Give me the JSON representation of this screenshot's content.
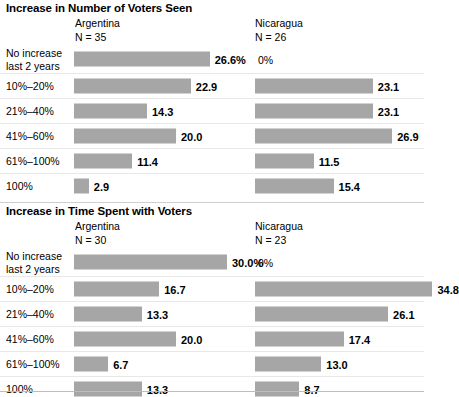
{
  "chart_data": [
    {
      "type": "bar",
      "title": "Increase in Number of Voters Seen",
      "xlabel": "",
      "ylabel": "",
      "orientation": "horizontal",
      "grid": false,
      "legend": "none",
      "xlim": [
        0,
        40
      ],
      "categories": [
        "No increase\nlast 2 years",
        "10%–20%",
        "21%–40%",
        "41%–60%",
        "61%–100%",
        "100%"
      ],
      "series": [
        {
          "name": "Argentina",
          "n_label": "N = 35",
          "values": [
            26.6,
            22.9,
            14.3,
            20.0,
            11.4,
            2.9
          ],
          "labels": [
            "26.6%",
            "22.9",
            "14.3",
            "20.0",
            "11.4",
            "2.9"
          ]
        },
        {
          "name": "Nicaragua",
          "n_label": "N = 26",
          "values": [
            0,
            23.1,
            23.1,
            26.9,
            11.5,
            15.4
          ],
          "labels": [
            "0%",
            "23.1",
            "23.1",
            "26.9",
            "11.5",
            "15.4"
          ]
        }
      ]
    },
    {
      "type": "bar",
      "title": "Increase in Time Spent with Voters",
      "xlabel": "",
      "ylabel": "",
      "orientation": "horizontal",
      "grid": false,
      "legend": "none",
      "xlim": [
        0,
        40
      ],
      "categories": [
        "No increase\nlast 2 years",
        "10%–20%",
        "21%–40%",
        "41%–60%",
        "61%–100%",
        "100%"
      ],
      "series": [
        {
          "name": "Argentina",
          "n_label": "N = 30",
          "values": [
            30.0,
            16.7,
            13.3,
            20.0,
            6.7,
            13.3
          ],
          "labels": [
            "30.0%",
            "16.7",
            "13.3",
            "20.0",
            "6.7",
            "13.3"
          ]
        },
        {
          "name": "Nicaragua",
          "n_label": "N = 23",
          "values": [
            0,
            34.8,
            26.1,
            17.4,
            13.0,
            8.7
          ],
          "labels": [
            "0%",
            "34.8",
            "26.1",
            "17.4",
            "13.0",
            "8.7"
          ]
        }
      ]
    }
  ],
  "style": {
    "bar_color": "#a6a6a6",
    "text_color": "#000000",
    "rule_color": "#bdbdbd",
    "row_line_color": "#e8e8e8",
    "px_per_unit": 5.1
  },
  "panels": [
    {
      "title": "Increase in Number of Voters Seen",
      "left_header": {
        "name": "Argentina",
        "n": "N = 35"
      },
      "right_header": {
        "name": "Nicaragua",
        "n": "N = 26"
      },
      "rows": [
        {
          "label": "No increase\nlast 2 years",
          "left_value": 26.6,
          "left_label": "26.6%",
          "right_value": 0,
          "right_label": "0%"
        },
        {
          "label": "10%–20%",
          "left_value": 22.9,
          "left_label": "22.9",
          "right_value": 23.1,
          "right_label": "23.1"
        },
        {
          "label": "21%–40%",
          "left_value": 14.3,
          "left_label": "14.3",
          "right_value": 23.1,
          "right_label": "23.1"
        },
        {
          "label": "41%–60%",
          "left_value": 20.0,
          "left_label": "20.0",
          "right_value": 26.9,
          "right_label": "26.9"
        },
        {
          "label": "61%–100%",
          "left_value": 11.4,
          "left_label": "11.4",
          "right_value": 11.5,
          "right_label": "11.5"
        },
        {
          "label": "100%",
          "left_value": 2.9,
          "left_label": "2.9",
          "right_value": 15.4,
          "right_label": "15.4"
        }
      ]
    },
    {
      "title": "Increase in Time Spent with Voters",
      "left_header": {
        "name": "Argentina",
        "n": "N = 30"
      },
      "right_header": {
        "name": "Nicaragua",
        "n": "N = 23"
      },
      "rows": [
        {
          "label": "No increase\nlast 2 years",
          "left_value": 30.0,
          "left_label": "30.0%",
          "right_value": 0,
          "right_label": "0%"
        },
        {
          "label": "10%–20%",
          "left_value": 16.7,
          "left_label": "16.7",
          "right_value": 34.8,
          "right_label": "34.8"
        },
        {
          "label": "21%–40%",
          "left_value": 13.3,
          "left_label": "13.3",
          "right_value": 26.1,
          "right_label": "26.1"
        },
        {
          "label": "41%–60%",
          "left_value": 20.0,
          "left_label": "20.0",
          "right_value": 17.4,
          "right_label": "17.4"
        },
        {
          "label": "61%–100%",
          "left_value": 6.7,
          "left_label": "6.7",
          "right_value": 13.0,
          "right_label": "13.0"
        },
        {
          "label": "100%",
          "left_value": 13.3,
          "left_label": "13.3",
          "right_value": 8.7,
          "right_label": "8.7"
        }
      ]
    }
  ]
}
